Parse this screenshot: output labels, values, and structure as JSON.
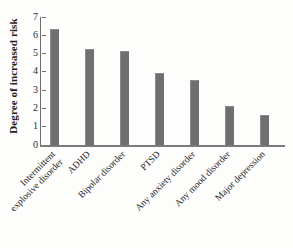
{
  "chart_data": {
    "type": "bar",
    "title": "",
    "xlabel": "",
    "ylabel": "Degree of increased risk",
    "ylim": [
      0,
      7
    ],
    "grid": false,
    "legend": null,
    "bar_color": "#6f6f6f",
    "axis_color": "#6d6d6d",
    "background_color": "#fdfdfc",
    "ytick_labels": [
      "7",
      "6",
      "5",
      "4",
      "3",
      "2",
      "1",
      "0"
    ],
    "ytick_values": [
      7,
      6,
      5,
      4,
      3,
      2,
      1,
      0
    ],
    "categories": [
      "Intermittent explosive disorder",
      "ADHD",
      "Bipolar disorder",
      "PTSD",
      "Any anxiety disorder",
      "Any mood disorder",
      "Major depression"
    ],
    "category_lines": [
      [
        "Intermittent",
        "explosive disorder"
      ],
      [
        "ADHD"
      ],
      [
        "Bipolar disorder"
      ],
      [
        "PTSD"
      ],
      [
        "Any anxiety disorder"
      ],
      [
        "Any mood disorder"
      ],
      [
        "Major depression"
      ]
    ],
    "values": [
      6.3,
      5.2,
      5.1,
      3.9,
      3.5,
      2.1,
      1.6
    ]
  }
}
